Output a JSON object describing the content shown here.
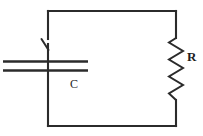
{
  "figure": {
    "background_color": "#ffffff",
    "line_color": "#2b2b2b",
    "label_color": "#1d1d1d"
  },
  "circuit": {
    "type": "series-rc-loop",
    "loop": {
      "name": "conducting-wire-loop",
      "left_x": 48,
      "right_x": 176,
      "top_y": 11,
      "bottom_y": 126
    },
    "components": [
      {
        "id": "capacitor",
        "symbol": "parallel-plate-capacitor",
        "label": "C",
        "label_x": 75,
        "label_y": 85,
        "plate_left_x": 3,
        "plate_right_x": 88,
        "upper_plate_y": 61,
        "lower_plate_y": 70,
        "branch": "left"
      },
      {
        "id": "switch",
        "symbol": "open-switch",
        "label": "",
        "branch": "left",
        "state": "open",
        "pivot_x": 48,
        "top_y": 38,
        "bottom_y": 50
      },
      {
        "id": "resistor",
        "symbol": "zigzag-resistor",
        "label": "R",
        "label_x": 192,
        "label_y": 57,
        "branch": "right",
        "top_y": 38,
        "bottom_y": 100,
        "zigzag_peaks": 7,
        "amplitude": 7
      }
    ]
  },
  "labels": {
    "capacitor": "C",
    "resistor": "R"
  }
}
